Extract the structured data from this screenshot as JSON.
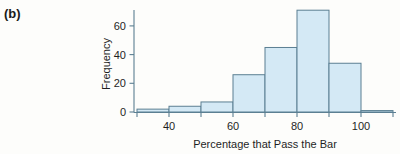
{
  "figure": {
    "panel_label": "(b)",
    "background_color": "#fdfdfb"
  },
  "chart_data": {
    "type": "bar",
    "subtype": "histogram",
    "title": "",
    "xlabel": "Percentage that Pass the Bar",
    "ylabel": "Frequency",
    "categories": [
      "30-40",
      "40-50",
      "50-60",
      "60-70",
      "70-80",
      "80-90",
      "90-100",
      "100-110"
    ],
    "bin_edges": [
      30,
      40,
      50,
      60,
      70,
      80,
      90,
      100,
      110
    ],
    "bin_width": 10,
    "values": [
      2,
      4,
      7,
      26,
      45,
      71,
      34,
      1
    ],
    "x": [
      35,
      45,
      55,
      65,
      75,
      85,
      95,
      105
    ],
    "xlim": [
      30,
      110
    ],
    "ylim": [
      0,
      75
    ],
    "xticks": [
      40,
      60,
      80,
      100
    ],
    "xtick_labels": [
      "40",
      "60",
      "80",
      "100"
    ],
    "xticks_minor": [
      30,
      50,
      70,
      90,
      110
    ],
    "yticks": [
      0,
      20,
      40,
      60
    ],
    "ytick_labels": [
      "0",
      "20",
      "40",
      "60"
    ],
    "grid": false,
    "legend": null,
    "bar_fill_color": "#d4e9f5",
    "bar_edge_color": "#5b7f92",
    "axis_color": "#5b7f92"
  }
}
